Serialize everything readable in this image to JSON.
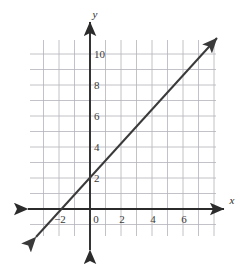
{
  "chart_data": {
    "type": "line",
    "title": "",
    "xlabel": "x",
    "ylabel": "y",
    "grid": true,
    "legend": false,
    "xlim": [
      -3.87,
      8.13
    ],
    "ylim": [
      -1.74,
      10.9
    ],
    "x_ticks": [
      -2,
      0,
      2,
      4,
      6
    ],
    "x_tick_labels": [
      "−2",
      "0",
      "2",
      "4",
      "6"
    ],
    "y_ticks": [
      2,
      4,
      6,
      8,
      10
    ],
    "y_tick_labels": [
      "2",
      "4",
      "6",
      "8",
      "10"
    ],
    "grid_step": 1,
    "series": [
      {
        "name": "line",
        "equation": "y = x + 3",
        "slope": 1,
        "intercept": 3,
        "color": "#3a3a3a",
        "arrows": "both",
        "points": [
          [
            -3.6,
            -0.6
          ],
          [
            0,
            3
          ],
          [
            2,
            5
          ],
          [
            8.1,
            11.1
          ]
        ]
      }
    ]
  },
  "axes": {
    "x_axis_label": "x",
    "y_axis_label": "y",
    "axis_color": "#2b2b2b",
    "grid_color": "#b2b2ba"
  },
  "ticks": {
    "x": [
      {
        "value": -2,
        "label": "−2"
      },
      {
        "value": 0,
        "label": "0"
      },
      {
        "value": 2,
        "label": "2"
      },
      {
        "value": 4,
        "label": "4"
      },
      {
        "value": 6,
        "label": "6"
      }
    ],
    "y": [
      {
        "value": 2,
        "label": "2"
      },
      {
        "value": 4,
        "label": "4"
      },
      {
        "value": 6,
        "label": "6"
      },
      {
        "value": 8,
        "label": "8"
      },
      {
        "value": 10,
        "label": "10"
      }
    ]
  }
}
